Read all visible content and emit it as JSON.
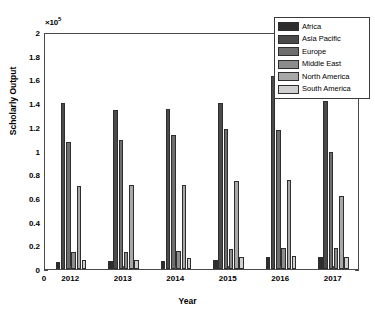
{
  "chart_data": {
    "type": "bar",
    "title": "",
    "subtitle": "",
    "xlabel": "Year",
    "ylabel": "Scholarly Output",
    "y_exponent_label": "×10",
    "y_exponent_power": "5",
    "origin_label": "0",
    "grid": false,
    "legend_position": "top-right",
    "categories": [
      "2012",
      "2013",
      "2014",
      "2015",
      "2016",
      "2017"
    ],
    "ylim": [
      0,
      2
    ],
    "ytick_values": [
      0,
      0.2,
      0.4,
      0.6,
      0.8,
      1,
      1.2,
      1.4,
      1.6,
      1.8,
      2
    ],
    "ytick_labels": [
      "0",
      "0.2",
      "0.4",
      "0.6",
      "0.8",
      "1",
      "1.2",
      "1.4",
      "1.6",
      "1.8",
      "2"
    ],
    "y_scale_factor": 100000,
    "series": [
      {
        "name": "Africa",
        "color": "#2d2d2d",
        "values": [
          0.06,
          0.07,
          0.07,
          0.08,
          0.1,
          0.1
        ]
      },
      {
        "name": "Asia Pacific",
        "color": "#4a4a4a",
        "values": [
          1.4,
          1.34,
          1.35,
          1.4,
          1.63,
          1.42
        ]
      },
      {
        "name": "Europe",
        "color": "#6e6e6e",
        "values": [
          1.07,
          1.09,
          1.13,
          1.18,
          1.17,
          0.99
        ]
      },
      {
        "name": "Middle East",
        "color": "#8c8c8c",
        "values": [
          0.14,
          0.145,
          0.15,
          0.17,
          0.18,
          0.175
        ]
      },
      {
        "name": "North America",
        "color": "#a8a8a8",
        "values": [
          0.7,
          0.71,
          0.71,
          0.74,
          0.75,
          0.62
        ]
      },
      {
        "name": "South America",
        "color": "#d0d0d0",
        "values": [
          0.08,
          0.08,
          0.09,
          0.1,
          0.11,
          0.1
        ]
      }
    ]
  },
  "legend": {
    "items": [
      {
        "label": "Africa"
      },
      {
        "label": "Asia Pacific"
      },
      {
        "label": "Europe"
      },
      {
        "label": "Middle East"
      },
      {
        "label": "North America"
      },
      {
        "label": "South America"
      }
    ]
  },
  "axes": {
    "y_title": "Scholarly Output",
    "x_title": "Year",
    "exponent_prefix": "×10",
    "exponent_power": "5",
    "origin": "0"
  }
}
